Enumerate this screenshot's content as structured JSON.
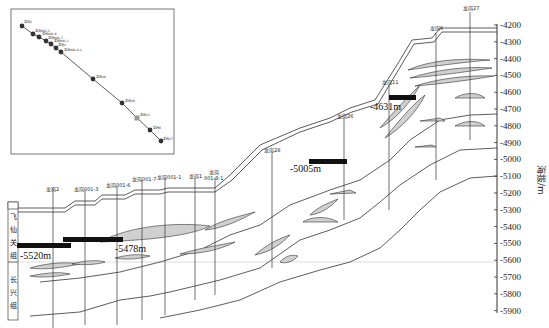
{
  "axis": {
    "label": "海拔/m",
    "ticks": [
      "-4200",
      "-4300",
      "-4400",
      "-4500",
      "-4600",
      "-4700",
      "-4800",
      "-4900",
      "-5000",
      "-5100",
      "-5200",
      "-5300",
      "-5400",
      "-5500",
      "-5600",
      "-5700",
      "-5800",
      "-5900"
    ]
  },
  "formations": {
    "upper": {
      "chars": [
        "飞",
        "仙",
        "关",
        "组"
      ]
    },
    "lower": {
      "chars": [
        "长",
        "兴",
        "组"
      ]
    }
  },
  "wells": [
    {
      "label": "龙岗2"
    },
    {
      "label": "龙岗001-3"
    },
    {
      "label": "龙岗001-6"
    },
    {
      "label": "龙岗001-7"
    },
    {
      "label": "龙岗001-1"
    },
    {
      "label": "龙岗1"
    },
    {
      "label": "龙岗"
    },
    {
      "label": "001-8-1"
    },
    {
      "label": "龙岗28"
    },
    {
      "label": "龙岗26"
    },
    {
      "label": "龙岗11"
    },
    {
      "label": "龙岗6"
    },
    {
      "label": "龙岗27"
    }
  ],
  "annotations": {
    "a1": "-5520m",
    "a2": "-5478m",
    "a3": "-5005m",
    "a4": "-4631m"
  },
  "inset": {
    "labels": [
      "龙岗2",
      "龙岗001-3",
      "龙岗001-6",
      "龙岗001-7",
      "龙岗001-1",
      "龙岗1",
      "龙岗001-8-1",
      "龙岗28",
      "龙岗26",
      "龙岗11",
      "龙岗6",
      "龙岗27"
    ]
  }
}
